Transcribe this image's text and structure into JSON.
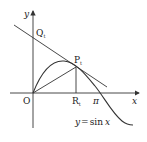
{
  "figure": {
    "axis_labels": {
      "x": "x",
      "y": "y"
    },
    "origin_label": "O",
    "points": {
      "P": {
        "letter": "P",
        "subscript": "t"
      },
      "Q": {
        "letter": "Q",
        "subscript": "t"
      },
      "R": {
        "letter": "R",
        "subscript": "t"
      }
    },
    "tick_labels": {
      "pi": "π"
    },
    "curve_label": {
      "lhs": "y",
      "eq": "=",
      "rhs_fn": "sin",
      "rhs_var": "x"
    },
    "colors": {
      "stroke": "#333333",
      "text": "#222222",
      "background": "#ffffff"
    }
  }
}
